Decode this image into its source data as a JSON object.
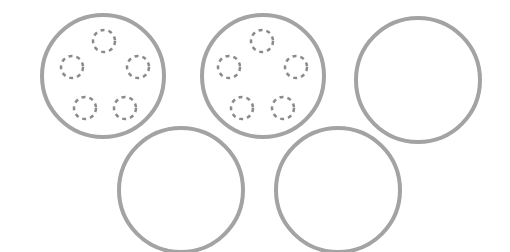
{
  "diagram": {
    "colors": {
      "ring_stroke": "#a3a3a3",
      "dashed_stroke": "#8a8a8a",
      "background": "#ffffff"
    },
    "rings": [
      {
        "id": "ring-1",
        "cx": 103,
        "cy": 76,
        "r": 61,
        "dots": [
          {
            "cx": 104,
            "cy": 41
          },
          {
            "cx": 72,
            "cy": 67
          },
          {
            "cx": 138,
            "cy": 67
          },
          {
            "cx": 85,
            "cy": 108
          },
          {
            "cx": 125,
            "cy": 108
          }
        ]
      },
      {
        "id": "ring-2",
        "cx": 263,
        "cy": 76,
        "r": 61,
        "dots": [
          {
            "cx": 262,
            "cy": 41
          },
          {
            "cx": 229,
            "cy": 67
          },
          {
            "cx": 296,
            "cy": 67
          },
          {
            "cx": 242,
            "cy": 108
          },
          {
            "cx": 283,
            "cy": 108
          }
        ]
      },
      {
        "id": "ring-3",
        "cx": 418,
        "cy": 80,
        "r": 62,
        "dots": []
      },
      {
        "id": "ring-4",
        "cx": 181,
        "cy": 190,
        "r": 62,
        "dots": []
      },
      {
        "id": "ring-5",
        "cx": 338,
        "cy": 190,
        "r": 62,
        "dots": []
      }
    ],
    "dot_radius": 11
  }
}
